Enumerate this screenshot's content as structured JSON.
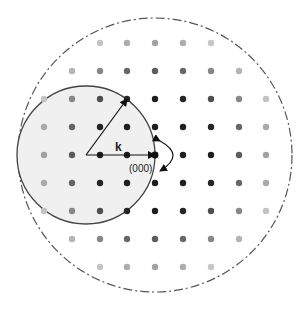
{
  "diagram": {
    "labels": {
      "wavevector": "k",
      "origin": "(000)"
    },
    "colors": {
      "ewald_fill": "#f0f0f0",
      "ewald_stroke": "#444444",
      "limiting_sphere_stroke": "#555555",
      "arrow": "#111111"
    },
    "geometry": {
      "lattice_spacing": 28,
      "origin_point": [
        155,
        155
      ],
      "ewald_center": [
        86,
        155
      ],
      "ewald_radius": 69,
      "limiting_center": [
        155,
        155
      ],
      "limiting_radius": 137
    },
    "lattice": {
      "columns_x": [
        44,
        72,
        100,
        127,
        155,
        183,
        211,
        239,
        266
      ],
      "rows_y": [
        43,
        71,
        99,
        127,
        155,
        183,
        211,
        239,
        267
      ],
      "visible_radius": 132
    },
    "arrows": [
      {
        "name": "k-incident",
        "from": [
          86,
          155
        ],
        "to": [
          155,
          155
        ]
      },
      {
        "name": "k-diffracted",
        "from": [
          86,
          155
        ],
        "to": [
          127,
          99
        ]
      },
      {
        "name": "rotation-arc",
        "description": "curved double arrow indicating crystal rotation about (000)"
      }
    ]
  }
}
